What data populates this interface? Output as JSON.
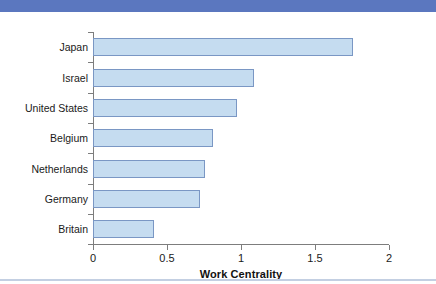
{
  "figure": {
    "top_band_color": "#5b77bf",
    "bottom_rule_color": "#c3cfe2",
    "background_color": "#ffffff"
  },
  "chart_data": {
    "type": "bar",
    "orientation": "horizontal",
    "title": "",
    "subtitle": "",
    "xlabel": "Work Centrality",
    "ylabel": "",
    "categories": [
      "Japan",
      "Israel",
      "United States",
      "Belgium",
      "Netherlands",
      "Germany",
      "Britain"
    ],
    "values": [
      1.76,
      1.09,
      0.97,
      0.81,
      0.76,
      0.72,
      0.41
    ],
    "xlim": [
      0,
      2
    ],
    "xticks": [
      0,
      0.5,
      1,
      1.5,
      2
    ],
    "xtick_labels": [
      "0",
      "0.5",
      "1",
      "1.5",
      "2"
    ],
    "grid": false,
    "legend": null,
    "bar_fill_color": "#c5dcf0",
    "bar_border_color": "#7a97c4",
    "axis_color": "#7d7d7d",
    "text_color": "#1a1a1a"
  }
}
